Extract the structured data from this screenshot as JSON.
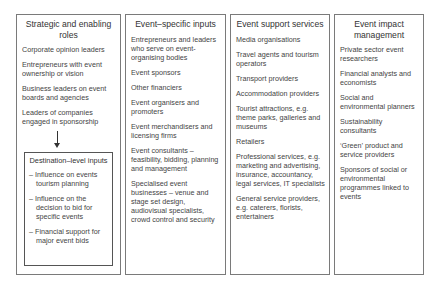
{
  "columns": [
    {
      "title": "Strategic and enabling roles",
      "items": [
        "Corporate opinion leaders",
        "Entrepreneurs with event ownership or vision",
        "Business leaders on event boards and agencies",
        "Leaders of companies engaged in sponsorship"
      ],
      "sub_box": {
        "title": "Destination–level inputs",
        "items": [
          "– Influence on events tourism planning",
          "– Influence on the decision to bid for specific events",
          "– Financial support for major event bids"
        ]
      }
    },
    {
      "title": "Event–specific inputs",
      "items": [
        "Entrepreneurs and leaders who serve on event-organising bodies",
        "Event sponsors",
        "Other financiers",
        "Event organisers and promoters",
        "Event merchandisers and licensing firms",
        "Event consultants – feasibility, bidding, planning and management",
        "Specialised event businesses – venue and stage set design, audiovisual specialists, crowd control and security"
      ]
    },
    {
      "title": "Event support services",
      "items": [
        "Media organisations",
        "Travel agents and tourism operators",
        "Transport providers",
        "Accommodation providers",
        "Tourist attractions, e.g. theme parks, galleries and museums",
        "Retailers",
        "Professional services, e.g. marketing and advertising, insurance, accountancy, legal services, IT specialists",
        "General service providers, e.g. caterers, florists, entertainers"
      ]
    },
    {
      "title": "Event impact management",
      "items": [
        "Private sector event researchers",
        "Financial analysts and economists",
        "Social and environmental planners",
        "Sustainability consultants",
        "‘Green’ product and service providers",
        "Sponsors of social or environmental programmes linked to events"
      ]
    }
  ]
}
